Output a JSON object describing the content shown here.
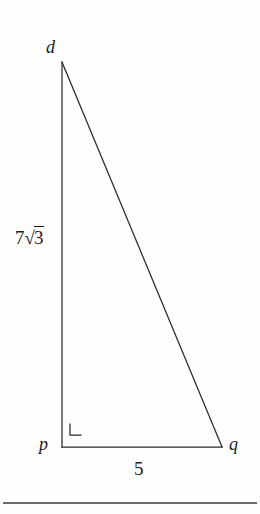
{
  "figure": {
    "kind": "right-triangle-diagram",
    "background_color": "#fefefe",
    "stroke_color": "#2a2a2a",
    "vertices": {
      "apex": {
        "label": "d",
        "x": 62,
        "y": 62
      },
      "right_angle": {
        "label": "p",
        "x": 62,
        "y": 447
      },
      "base_right": {
        "label": "q",
        "x": 222,
        "y": 447
      }
    },
    "side_labels": {
      "vertical_leg_coefficient": "7",
      "vertical_leg_radical_symbol": "√",
      "vertical_leg_radicand": "3",
      "vertical_leg_full": "7√3",
      "base_leg": "5",
      "hypotenuse": ""
    },
    "right_angle_marker": {
      "name": "right-angle-marker",
      "x": 70,
      "y": 424,
      "size": 11
    },
    "rule": {
      "x1": 3,
      "y1": 503,
      "x2": 257,
      "y2": 503
    }
  }
}
